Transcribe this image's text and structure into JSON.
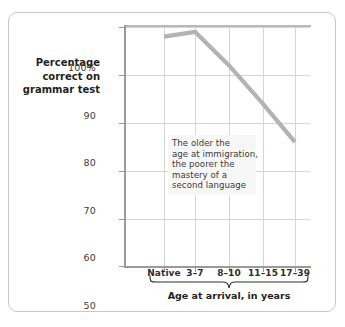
{
  "chart_data": {
    "type": "line",
    "title": "",
    "xlabel": "Age at arrival, in years",
    "ylabel": "Percentage correct on grammar test",
    "ylabel_lines": [
      "Percentage",
      "correct on",
      "grammar test"
    ],
    "categories": [
      "Native",
      "3–7",
      "8–10",
      "11–15",
      "17–39"
    ],
    "values": [
      98,
      99,
      92,
      84,
      76
    ],
    "series": [
      {
        "name": "Percentage correct on grammar test",
        "values": [
          98,
          99,
          92,
          84,
          76
        ],
        "color": "#b3b3b3"
      }
    ],
    "ylim": [
      50,
      100
    ],
    "yticks": [
      100,
      90,
      80,
      70,
      60,
      50
    ],
    "ytick_labels": [
      "100%",
      "90",
      "80",
      "70",
      "60",
      "50"
    ],
    "grid": true,
    "legend": "none",
    "annotations": [
      {
        "name": "trend-callout",
        "lines": [
          "The older the",
          "age at immigration,",
          "the poorer the",
          "mastery of a",
          "second language"
        ]
      }
    ],
    "bracket": {
      "label": "Age at arrival, in years",
      "spans": [
        "3–7",
        "8–10",
        "11–15",
        "17–39"
      ]
    },
    "colors": {
      "line": "#b3b3b3",
      "grid": "#d4d4d4",
      "axis": "#9a9a9a",
      "frame": "#c9c9c9",
      "annotation_background": "#f7f7f7",
      "text": "#1f1f1f"
    }
  }
}
